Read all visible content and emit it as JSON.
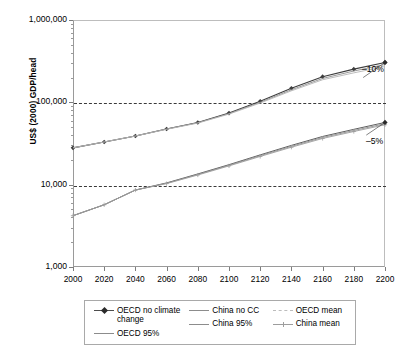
{
  "chart_data": {
    "type": "line",
    "title": "",
    "xlabel": "",
    "ylabel": "US$ (2000) GDP/head",
    "xlim": [
      2000,
      2200
    ],
    "ylim": [
      1000,
      1000000
    ],
    "yscale": "log",
    "xticks": [
      2000,
      2020,
      2040,
      2060,
      2080,
      2100,
      2120,
      2140,
      2160,
      2180,
      2200
    ],
    "xtick_labels": [
      "2000",
      "2020",
      "2040",
      "2060",
      "2080",
      "2100",
      "2120",
      "2140",
      "2160",
      "2180",
      "2200"
    ],
    "yticks": [
      1000,
      10000,
      100000,
      1000000
    ],
    "ytick_labels": [
      "1,000",
      "10,000",
      "100,000",
      "1,000,000"
    ],
    "grid": "horizontal dashed at 10,000 and 100,000",
    "legend_position": "below plot, 3 columns",
    "x": [
      2000,
      2020,
      2040,
      2060,
      2080,
      2100,
      2120,
      2140,
      2160,
      2180,
      2200
    ],
    "series": [
      {
        "name": "OECD no climate change",
        "marker": "diamond",
        "color": "#3d3d3d",
        "values": [
          28000,
          33000,
          39000,
          47500,
          57000,
          74000,
          103000,
          148000,
          205000,
          253000,
          305000
        ]
      },
      {
        "name": "OECD 95%",
        "marker": "none",
        "color": "#8c8c8c",
        "values": [
          28000,
          33000,
          39000,
          47500,
          56500,
          73000,
          100000,
          142000,
          195000,
          240000,
          288000
        ]
      },
      {
        "name": "OECD mean",
        "marker": "dash",
        "color": "#b5b5b5",
        "values": [
          28000,
          33000,
          39000,
          47000,
          56000,
          72000,
          98000,
          138000,
          188000,
          228000,
          272000
        ]
      },
      {
        "name": "China no CC",
        "marker": "none",
        "color": "#4d4d4d",
        "values": [
          4200,
          5700,
          8600,
          10500,
          13500,
          17500,
          23000,
          30000,
          38500,
          47000,
          57000
        ]
      },
      {
        "name": "China 95%",
        "marker": "none",
        "color": "#8c8c8c",
        "values": [
          4200,
          5700,
          8600,
          10400,
          13300,
          17200,
          22500,
          29200,
          37400,
          45500,
          55000
        ]
      },
      {
        "name": "China mean",
        "marker": "plus",
        "color": "#9d9d9d",
        "values": [
          4200,
          5700,
          8600,
          10300,
          13100,
          16900,
          22000,
          28500,
          36400,
          44200,
          53400
        ]
      }
    ],
    "annotations": [
      {
        "text": "–10%",
        "x": 2200,
        "y": 305000,
        "note": "points to OECD bundle endpoint at 2200"
      },
      {
        "text": "–5%",
        "x": 2200,
        "y": 57000,
        "note": "points to China bundle endpoint at 2200"
      }
    ]
  },
  "axes": {
    "y_title": "US$ (2000) GDP/head",
    "y_labels": [
      "1,000,000",
      "100,000",
      "10,000",
      "1,000"
    ],
    "x_labels": [
      "2000",
      "2020",
      "2040",
      "2060",
      "2080",
      "2100",
      "2120",
      "2140",
      "2160",
      "2180",
      "2200"
    ]
  },
  "annotations": {
    "upper": "–10%",
    "lower": "–5%"
  },
  "legend": {
    "col1": [
      {
        "label": "OECD no climate change",
        "marker": "diamond"
      },
      {
        "label": "OECD 95%",
        "marker": "none"
      }
    ],
    "col2": [
      {
        "label": "China no CC",
        "marker": "none"
      },
      {
        "label": "China 95%",
        "marker": "none"
      }
    ],
    "col3": [
      {
        "label": "OECD mean",
        "marker": "dash"
      },
      {
        "label": "China mean",
        "marker": "plus"
      }
    ]
  },
  "colors": {
    "series_dark": "#3d3d3d",
    "series_mid": "#8c8c8c",
    "series_light": "#b5b5b5",
    "axis": "#9a9a9a",
    "grid": "#3a3a3a"
  }
}
